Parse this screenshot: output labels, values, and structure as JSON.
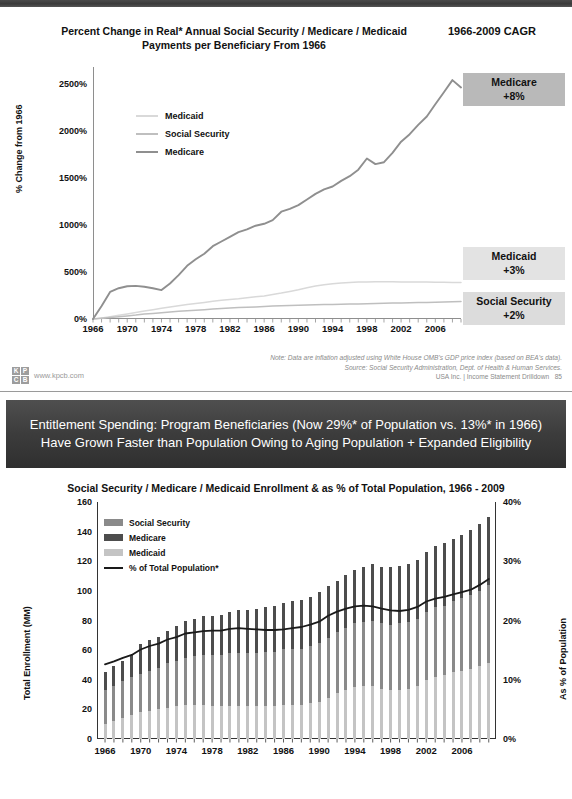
{
  "slide1": {
    "title": "Percent Change in Real* Annual Social Security / Medicare / Medicaid Payments per Beneficiary From 1966",
    "cagr_header": "1966-2009 CAGR",
    "y_axis_title": "% Change from 1966",
    "y_ticks": [
      "0%",
      "500%",
      "1000%",
      "1500%",
      "2000%",
      "2500%"
    ],
    "x_ticks": [
      "1966",
      "1970",
      "1974",
      "1978",
      "1982",
      "1986",
      "1990",
      "1994",
      "1998",
      "2002",
      "2006"
    ],
    "legend": [
      {
        "label": "Medicaid",
        "color": "#d9d9d9"
      },
      {
        "label": "Social Security",
        "color": "#bfbfbf"
      },
      {
        "label": "Medicare",
        "color": "#8f8f8f"
      }
    ],
    "callouts": [
      {
        "name": "Medicare",
        "value": "+8%",
        "bg": "#b9b9b9"
      },
      {
        "name": "Medicaid",
        "value": "+3%",
        "bg": "#e3e3e3"
      },
      {
        "name": "Social Security",
        "value": "+2%",
        "bg": "#dcdcdc"
      }
    ],
    "note": "Note: Data are inflation adjusted using White House OMB's GDP price index (based on BEA's data).",
    "source": "Source: Social Security Administration, Dept. of Health & Human Services.",
    "footer_right": "USA Inc. | Income Statement Drilldown",
    "page_number": "85",
    "kpcb_url": "www.kpcb.com",
    "kpcb_letters": [
      "K",
      "P",
      "C",
      "B"
    ]
  },
  "banner": {
    "text": "Entitlement Spending: Program Beneficiaries (Now 29%* of Population vs. 13%* in 1966) Have Grown Faster than Population Owing to Aging Population + Expanded Eligibility",
    "bg": "#3c3c3c",
    "color": "#ffffff"
  },
  "slide2": {
    "title": "Social Security / Medicare / Medicaid Enrollment & as % of Total Population, 1966 - 2009",
    "y_axis_title": "Total Enrollment (MM)",
    "r_axis_title": "As % of Population",
    "y_ticks": [
      "0",
      "20",
      "40",
      "60",
      "80",
      "100",
      "120",
      "140",
      "160"
    ],
    "r_ticks": [
      "0%",
      "10%",
      "20%",
      "30%",
      "40%"
    ],
    "x_ticks": [
      "1966",
      "1970",
      "1974",
      "1978",
      "1982",
      "1986",
      "1990",
      "1994",
      "1998",
      "2002",
      "2006"
    ],
    "legend": [
      {
        "label": "Social Security",
        "color": "#8a8a8a"
      },
      {
        "label": "Medicare",
        "color": "#4d4d4d"
      },
      {
        "label": "Medicaid",
        "color": "#c4c4c4"
      },
      {
        "label": "% of Total Population*",
        "color": "#1a1a1a"
      }
    ]
  },
  "chart_data": [
    {
      "type": "line",
      "id": "percent-change-real-payments",
      "title": "Percent Change in Real* Annual Social Security / Medicare / Medicaid Payments per Beneficiary From 1966",
      "xlabel": "",
      "ylabel": "% Change from 1966",
      "ylim": [
        0,
        2700
      ],
      "xlim": [
        1966,
        2009
      ],
      "grid": false,
      "legend_position": "inside-upper-left",
      "x": [
        1966,
        1967,
        1968,
        1969,
        1970,
        1971,
        1972,
        1973,
        1974,
        1975,
        1976,
        1977,
        1978,
        1979,
        1980,
        1981,
        1982,
        1983,
        1984,
        1985,
        1986,
        1987,
        1988,
        1989,
        1990,
        1991,
        1992,
        1993,
        1994,
        1995,
        1996,
        1997,
        1998,
        1999,
        2000,
        2001,
        2002,
        2003,
        2004,
        2005,
        2006,
        2007,
        2008,
        2009
      ],
      "series": [
        {
          "name": "Medicare",
          "color": "#8f8f8f",
          "values": [
            0,
            140,
            290,
            330,
            350,
            355,
            345,
            330,
            310,
            380,
            470,
            570,
            640,
            700,
            780,
            830,
            880,
            930,
            960,
            1000,
            1020,
            1060,
            1150,
            1180,
            1220,
            1280,
            1340,
            1390,
            1420,
            1480,
            1530,
            1600,
            1720,
            1660,
            1680,
            1780,
            1900,
            1980,
            2080,
            2170,
            2300,
            2430,
            2560,
            2480
          ]
        },
        {
          "name": "Social Security",
          "color": "#bfbfbf",
          "values": [
            0,
            8,
            16,
            25,
            33,
            42,
            52,
            60,
            68,
            76,
            82,
            88,
            94,
            100,
            106,
            112,
            118,
            122,
            126,
            130,
            134,
            138,
            141,
            144,
            147,
            150,
            152,
            154,
            156,
            158,
            160,
            162,
            164,
            166,
            168,
            170,
            172,
            174,
            176,
            178,
            180,
            182,
            184,
            186
          ]
        },
        {
          "name": "Medicaid",
          "color": "#d9d9d9",
          "values": [
            0,
            12,
            25,
            40,
            55,
            70,
            86,
            100,
            115,
            130,
            142,
            154,
            166,
            178,
            190,
            200,
            210,
            218,
            228,
            238,
            248,
            262,
            278,
            296,
            314,
            334,
            352,
            366,
            378,
            386,
            392,
            396,
            398,
            400,
            400,
            399,
            398,
            397,
            396,
            395,
            394,
            393,
            392,
            392
          ]
        }
      ],
      "annotations": [
        {
          "text": "Medicare +8%",
          "series": "Medicare"
        },
        {
          "text": "Medicaid +3%",
          "series": "Medicaid"
        },
        {
          "text": "Social Security +2%",
          "series": "Social Security"
        }
      ]
    },
    {
      "type": "bar",
      "id": "enrollment-and-share-of-population",
      "title": "Social Security / Medicare / Medicaid Enrollment & as % of Total Population, 1966 - 2009",
      "xlabel": "",
      "ylabel": "Total Enrollment (MM)",
      "y2label": "As % of Population",
      "ylim": [
        0,
        160
      ],
      "y2lim": [
        0,
        40
      ],
      "grid": false,
      "stacked": true,
      "legend_position": "inside-upper-left",
      "categories": [
        1966,
        1967,
        1968,
        1969,
        1970,
        1971,
        1972,
        1973,
        1974,
        1975,
        1976,
        1977,
        1978,
        1979,
        1980,
        1981,
        1982,
        1983,
        1984,
        1985,
        1986,
        1987,
        1988,
        1989,
        1990,
        1991,
        1992,
        1993,
        1994,
        1995,
        1996,
        1997,
        1998,
        1999,
        2000,
        2001,
        2002,
        2003,
        2004,
        2005,
        2006,
        2007,
        2008,
        2009
      ],
      "series": [
        {
          "name": "Medicaid",
          "color": "#c4c4c4",
          "values": [
            10,
            12,
            14,
            16,
            18,
            19,
            20,
            21,
            22,
            23,
            23,
            23,
            22,
            22,
            22,
            22,
            22,
            22,
            22,
            22,
            23,
            23,
            23,
            24,
            25,
            28,
            31,
            33,
            35,
            36,
            36,
            34,
            33,
            33,
            34,
            36,
            40,
            42,
            43,
            45,
            46,
            47,
            49,
            51
          ]
        },
        {
          "name": "Social Security",
          "color": "#8a8a8a",
          "values": [
            23,
            24,
            25,
            26,
            26,
            27,
            28,
            30,
            31,
            32,
            33,
            34,
            35,
            35,
            36,
            36,
            36,
            36,
            37,
            37,
            38,
            38,
            38,
            39,
            40,
            40,
            41,
            42,
            43,
            43,
            44,
            44,
            44,
            45,
            45,
            45,
            46,
            47,
            47,
            48,
            49,
            50,
            51,
            53
          ]
        },
        {
          "name": "Medicare",
          "color": "#4d4d4d",
          "values": [
            12,
            13,
            14,
            15,
            20,
            21,
            21,
            22,
            23,
            25,
            25,
            26,
            26,
            27,
            28,
            29,
            29,
            30,
            30,
            31,
            31,
            32,
            33,
            33,
            34,
            35,
            35,
            36,
            36,
            37,
            38,
            38,
            39,
            39,
            39,
            40,
            40,
            41,
            42,
            42,
            43,
            44,
            45,
            46
          ]
        }
      ],
      "line_series": {
        "name": "% of Total Population*",
        "color": "#1a1a1a",
        "axis": "right",
        "values": [
          12.6,
          13.1,
          13.7,
          14.2,
          15.1,
          15.7,
          16.1,
          16.8,
          17.2,
          17.8,
          18.0,
          18.2,
          18.3,
          18.3,
          18.6,
          18.7,
          18.6,
          18.5,
          18.4,
          18.4,
          18.5,
          18.7,
          18.9,
          19.3,
          19.8,
          20.8,
          21.5,
          22.0,
          22.4,
          22.5,
          22.4,
          22.0,
          21.7,
          21.6,
          21.8,
          22.3,
          23.2,
          23.7,
          24.0,
          24.4,
          24.8,
          25.2,
          26.0,
          27.0
        ]
      }
    }
  ]
}
